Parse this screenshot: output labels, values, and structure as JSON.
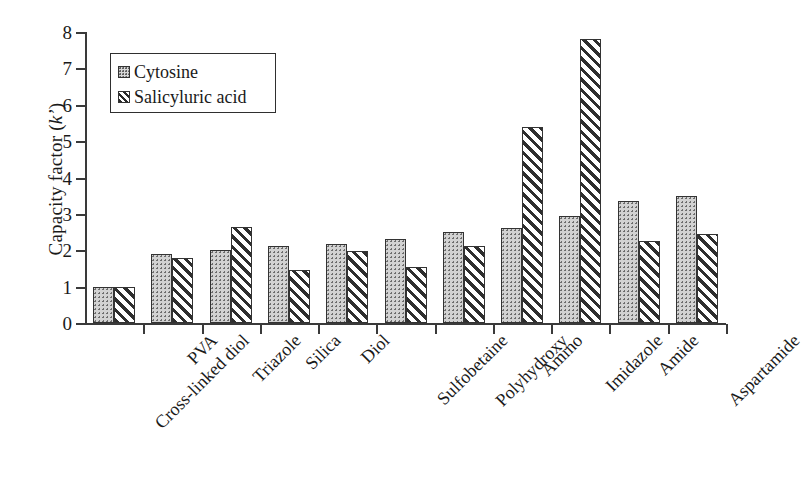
{
  "chart_data": {
    "type": "bar",
    "title": "",
    "subtitle": "",
    "xlabel": "",
    "ylabel": "Capacity factor (k')",
    "ylabel_plain": "Capacity factor",
    "ylabel_symbol": "k'",
    "ylim": [
      0,
      8
    ],
    "ytick_labels": [
      "0",
      "1",
      "2",
      "3",
      "4",
      "5",
      "6",
      "7",
      "8"
    ],
    "ytick_values": [
      0,
      1,
      2,
      3,
      4,
      5,
      6,
      7,
      8
    ],
    "grid": false,
    "legend_position": "upper-left-inside",
    "categories": [
      "Cross-linked diol",
      "PVA",
      "Triazole",
      "Silica",
      "Diol",
      "Sulfobetaine",
      "Polyhydroxy",
      "Amino",
      "Imidazole",
      "Amide",
      "Aspartamide"
    ],
    "series": [
      {
        "name": "Cytosine",
        "pattern": "dotted",
        "color": "#d2d2d2",
        "values": [
          1.0,
          1.9,
          2.0,
          2.12,
          2.17,
          2.3,
          2.5,
          2.6,
          2.95,
          3.35,
          3.5
        ]
      },
      {
        "name": "Salicyluric acid",
        "pattern": "diagonal-hatch",
        "color": "#2e2e2e",
        "values": [
          1.0,
          1.8,
          2.65,
          1.45,
          1.98,
          1.55,
          2.12,
          5.4,
          7.8,
          2.25,
          2.45
        ]
      }
    ]
  },
  "legend": {
    "items": [
      {
        "label": "Cytosine",
        "swatch": "dotted-swatch"
      },
      {
        "label": "Salicyluric acid",
        "swatch": "hatched-swatch"
      }
    ]
  },
  "axes": {
    "y_title_prefix": "Capacity factor (",
    "y_title_symbol": "k’",
    "y_title_suffix": ")"
  }
}
